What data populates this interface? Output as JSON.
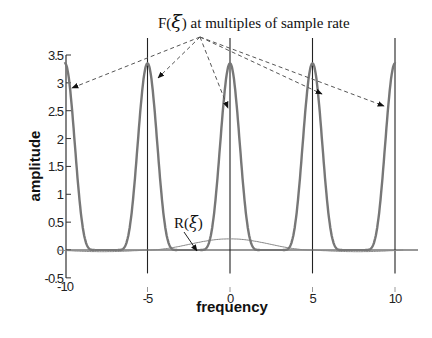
{
  "chart_data": {
    "type": "line",
    "title": "",
    "xlabel": "frequency",
    "ylabel": "amplitude",
    "xlim": [
      -11,
      11
    ],
    "ylim": [
      -0.5,
      3.5
    ],
    "xticks": [
      -10,
      -5,
      0,
      5,
      10
    ],
    "xtick_labels": [
      "-10",
      "-5",
      "0",
      "5",
      "10"
    ],
    "yticks": [
      -0.5,
      0,
      0.5,
      1,
      1.5,
      2,
      2.5,
      3,
      3.5
    ],
    "ytick_labels": [
      "-0.5",
      "0",
      "0.5",
      "1",
      "1.5",
      "2",
      "2.5",
      "3",
      "3.5"
    ],
    "grid": false,
    "vertical_lines_x": [
      -5,
      0,
      5,
      10
    ],
    "series": [
      {
        "name": "F(ξ) at multiples of sample rate",
        "description": "periodic spectrum replicas centered at multiples of sample rate 5",
        "centers": [
          -10,
          -5,
          0,
          5,
          10
        ],
        "peak_amplitude": 3.35,
        "half_width_at_base": 1.5,
        "color": "#777777"
      },
      {
        "name": "R(ξ)",
        "description": "broad low-amplitude response centered at 0",
        "x": [
          -10,
          -7.5,
          -5,
          -2.5,
          0,
          2.5,
          5,
          7.5,
          10
        ],
        "values": [
          -0.03,
          -0.03,
          0.0,
          0.12,
          0.2,
          0.12,
          0.0,
          -0.03,
          -0.03
        ],
        "color": "#888888"
      }
    ],
    "annotations": [
      {
        "text_prefix": "F(",
        "text_symbol": "ξ",
        "text_suffix": ") at multiples of sample rate",
        "arrow_targets_x": [
          -10,
          -5,
          0,
          5,
          10
        ]
      },
      {
        "text_prefix": "R(",
        "text_symbol": "ξ",
        "text_suffix": ")",
        "arrow_target_x": -1.5
      }
    ]
  },
  "layout": {
    "plot": {
      "x_min_px": 66,
      "x_zero_px": 230,
      "x_max_px": 395,
      "y_top_px": 55,
      "y_zero_px": 250,
      "y_bottom_px": 278,
      "axis_right_px": 418,
      "vline_top_px": 38
    }
  },
  "colors": {
    "axis": "#333333",
    "f_curve": "#7a7a7a",
    "r_curve": "#8a8a8a",
    "vline": "#222222",
    "arrow": "#555555"
  }
}
